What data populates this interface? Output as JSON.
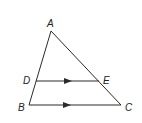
{
  "diagram": {
    "stroke_color": "#2a2a2a",
    "points": {
      "A": {
        "label": "A",
        "x": 51,
        "y": 31
      },
      "B": {
        "label": "B",
        "x": 29,
        "y": 105
      },
      "C": {
        "label": "C",
        "x": 121,
        "y": 105
      },
      "D": {
        "label": "D",
        "x": 36,
        "y": 81
      },
      "E": {
        "label": "E",
        "x": 99,
        "y": 81
      }
    },
    "segments": [
      "AB",
      "AC",
      "BC",
      "DE"
    ],
    "parallel_marks": [
      "DE",
      "BC"
    ]
  }
}
